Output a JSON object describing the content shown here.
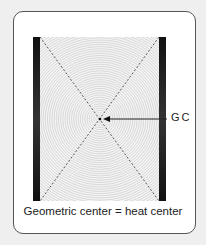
{
  "diagram": {
    "label_gc": "GC",
    "caption": "Geometric center = heat center",
    "center": {
      "x": 100,
      "y": 119
    },
    "colors": {
      "bars": "#111111",
      "rings": "#c8c8c8",
      "background": "#efefef",
      "card": "#ffffff"
    }
  }
}
